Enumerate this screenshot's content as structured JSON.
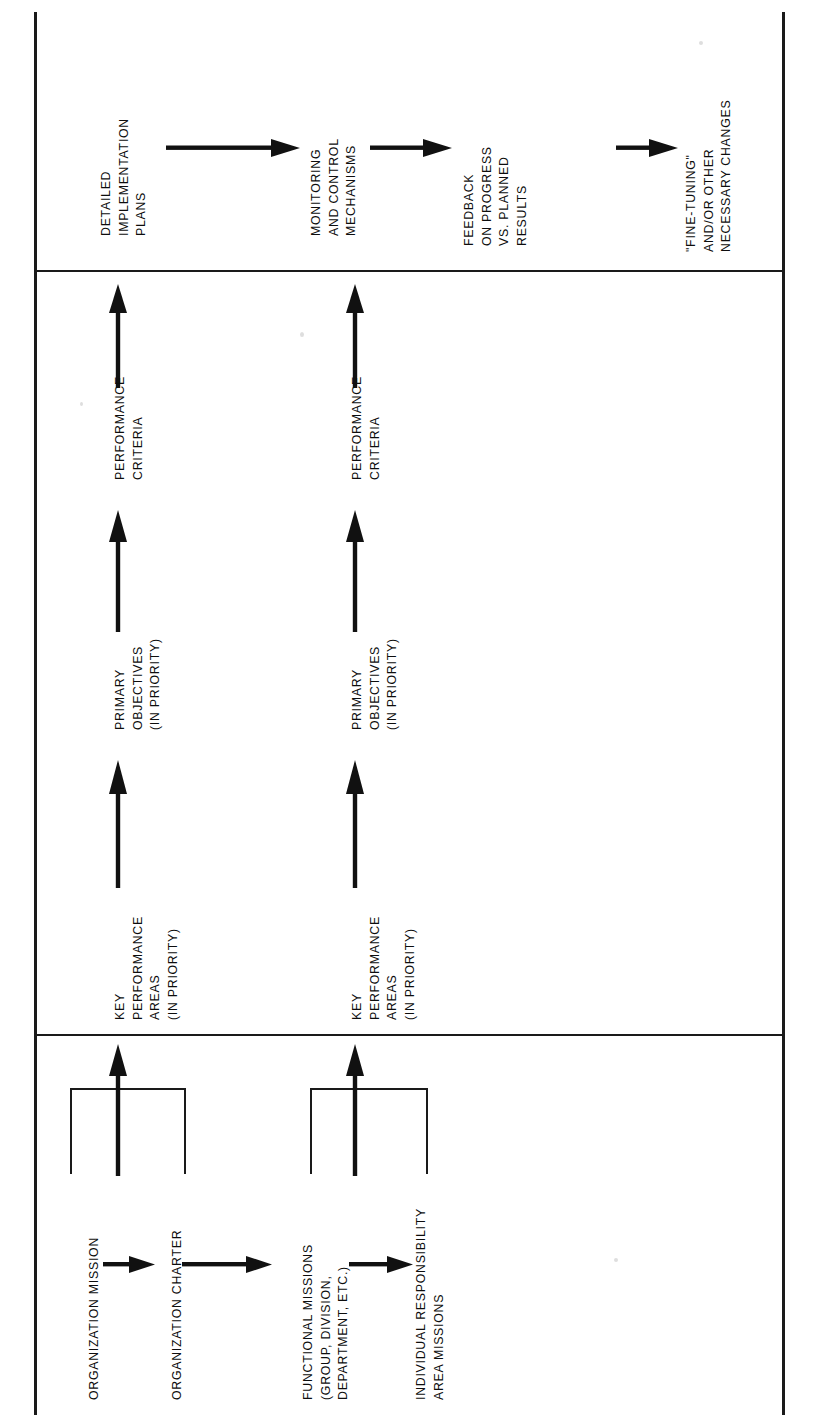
{
  "figure": {
    "type": "flowchart",
    "orientation": "rotated-90-ccw",
    "background_color": "#ffffff",
    "ink_color": "#1a1a1a"
  },
  "panels": [
    {
      "id": "implementation-control-panel",
      "nodes": [
        {
          "id": "detailed-implementation-plans",
          "lines": [
            "DETAILED",
            "IMPLEMENTATION",
            "PLANS"
          ]
        },
        {
          "id": "monitoring-and-control-mechanisms",
          "lines": [
            "MONITORING",
            "AND CONTROL",
            "MECHANISMS"
          ]
        },
        {
          "id": "feedback-on-progress",
          "lines": [
            "FEEDBACK",
            "ON PROGRESS",
            "VS. PLANNED",
            "RESULTS"
          ]
        },
        {
          "id": "fine-tuning-changes",
          "lines": [
            "\"FINE-TUNING\"",
            "AND/OR OTHER",
            "NECESSARY CHANGES"
          ]
        }
      ],
      "connectors": [
        "arrow-right",
        "arrow-right",
        "arrow-right"
      ]
    },
    {
      "id": "objectives-criteria-panel",
      "chains": [
        {
          "id": "chain-organization",
          "nodes": [
            {
              "id": "key-performance-areas-1",
              "lines": [
                "KEY",
                "PERFORMANCE",
                "AREAS",
                "(IN PRIORITY)"
              ]
            },
            {
              "id": "primary-objectives-1",
              "lines": [
                "PRIMARY",
                "OBJECTIVES",
                "(IN PRIORITY)"
              ]
            },
            {
              "id": "performance-criteria-1",
              "lines": [
                "PERFORMANCE",
                "CRITERIA"
              ]
            }
          ],
          "connectors": [
            "arrow-up",
            "arrow-up",
            "arrow-up"
          ]
        },
        {
          "id": "chain-individual",
          "nodes": [
            {
              "id": "key-performance-areas-2",
              "lines": [
                "KEY",
                "PERFORMANCE",
                "AREAS",
                "(IN PRIORITY)"
              ]
            },
            {
              "id": "primary-objectives-2",
              "lines": [
                "PRIMARY",
                "OBJECTIVES",
                "(IN PRIORITY)"
              ]
            },
            {
              "id": "performance-criteria-2",
              "lines": [
                "PERFORMANCE",
                "CRITERIA"
              ]
            }
          ],
          "connectors": [
            "arrow-up",
            "arrow-up",
            "arrow-up"
          ]
        }
      ]
    },
    {
      "id": "missions-panel",
      "nodes": [
        {
          "id": "organization-mission",
          "lines": [
            "ORGANIZATION MISSION"
          ]
        },
        {
          "id": "organization-charter",
          "lines": [
            "ORGANIZATION CHARTER"
          ]
        },
        {
          "id": "functional-missions",
          "lines": [
            "FUNCTIONAL MISSIONS",
            "(GROUP, DIVISION,",
            "DEPARTMENT, ETC.)"
          ]
        },
        {
          "id": "individual-responsibility-area-missions",
          "lines": [
            "INDIVIDUAL RESPONSIBILITY",
            "AREA MISSIONS"
          ]
        }
      ],
      "connectors": [
        "arrow-right",
        "arrow-right",
        "arrow-right"
      ],
      "groupings": [
        {
          "id": "bracket-organization",
          "groups": [
            "organization-mission",
            "organization-charter"
          ],
          "output": "arrow-up"
        },
        {
          "id": "bracket-functional",
          "groups": [
            "functional-missions",
            "individual-responsibility-area-missions"
          ],
          "output": "arrow-up"
        }
      ]
    }
  ]
}
